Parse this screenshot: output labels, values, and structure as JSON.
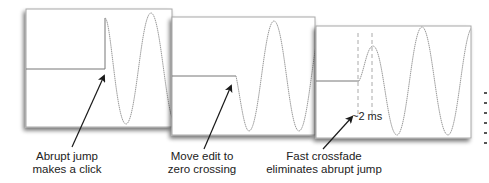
{
  "figure": {
    "panels": [
      {
        "id": "abrupt-jump",
        "caption_lines": [
          "Abrupt jump",
          "makes a click"
        ]
      },
      {
        "id": "zero-crossing",
        "caption_lines": [
          "Move edit to",
          "zero crossing"
        ]
      },
      {
        "id": "crossfade",
        "caption_lines": [
          "Fast crossfade",
          "eliminates abrupt jump"
        ],
        "annotation": "~2 ms"
      }
    ],
    "colors": {
      "panel_bg": "#ffffff",
      "panel_border": "#a8a8a8",
      "waveform": "#9a9a9a",
      "baseline": "#777777",
      "arrow": "#1a1a1a",
      "dash": "#aaaaaa",
      "text": "#222222"
    }
  }
}
